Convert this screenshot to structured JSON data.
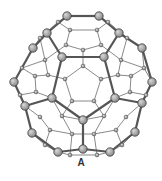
{
  "figure": {
    "label": "A",
    "colors": {
      "bond": "#6b6b6b",
      "bond_front": "#555555",
      "atom_fill": "#8a8a8a",
      "atom_highlight": "#d8d8d8",
      "atom_stroke": "#3a3a3a",
      "label": "#333333"
    }
  }
}
